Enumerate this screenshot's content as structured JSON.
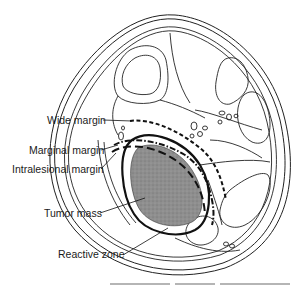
{
  "figure": {
    "type": "cross-section-diagram",
    "labels": [
      {
        "id": "wide",
        "text": "Wide margin",
        "line_style": "dashed"
      },
      {
        "id": "marginal",
        "text": "Marginal margin",
        "line_style": "dash-dot"
      },
      {
        "id": "intralesional",
        "text": "Intralesional margin",
        "line_style": "long-dash"
      },
      {
        "id": "tumor",
        "text": "Tumor mass",
        "line_style": "none"
      },
      {
        "id": "reactive",
        "text": "Reactive zone",
        "line_style": "solid-thick"
      }
    ],
    "colors": {
      "ink": "#1a1a1a",
      "tumor_fill": "#8a8a8a",
      "background": "#ffffff"
    }
  }
}
